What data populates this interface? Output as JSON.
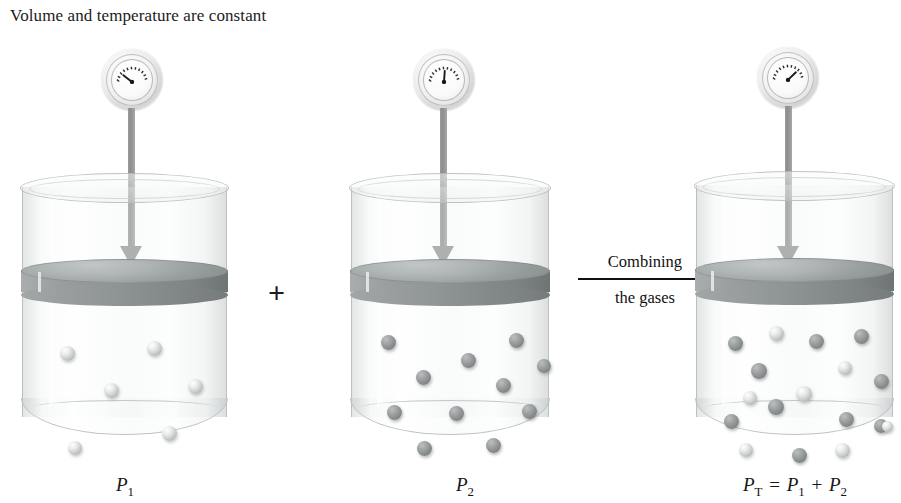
{
  "caption": "Volume and temperature are constant",
  "operators": {
    "plus": "+"
  },
  "transition": {
    "label_top": "Combining",
    "label_bottom": "the gases"
  },
  "cylinders": [
    {
      "id": "cylinder-1",
      "gauge_name": "pressure-gauge-1",
      "gauge_needle_angle_deg": -52,
      "label_main": "P",
      "label_sub": "1",
      "label_full": "P₁",
      "molecule_counts": {
        "light": 6,
        "dark": 0
      },
      "molecules": [
        {
          "type": "light",
          "x": 38,
          "y": 173,
          "size": 15
        },
        {
          "type": "light",
          "x": 125,
          "y": 168,
          "size": 15
        },
        {
          "type": "light",
          "x": 82,
          "y": 210,
          "size": 15
        },
        {
          "type": "light",
          "x": 166,
          "y": 206,
          "size": 15
        },
        {
          "type": "light",
          "x": 140,
          "y": 253,
          "size": 15
        },
        {
          "type": "light",
          "x": 46,
          "y": 268,
          "size": 14
        }
      ]
    },
    {
      "id": "cylinder-2",
      "gauge_name": "pressure-gauge-2",
      "gauge_needle_angle_deg": 4,
      "label_main": "P",
      "label_sub": "2",
      "label_full": "P₂",
      "molecule_counts": {
        "light": 0,
        "dark": 11
      },
      "molecules": [
        {
          "type": "dark",
          "x": 30,
          "y": 162,
          "size": 15
        },
        {
          "type": "dark",
          "x": 158,
          "y": 160,
          "size": 15
        },
        {
          "type": "dark",
          "x": 110,
          "y": 180,
          "size": 15
        },
        {
          "type": "dark",
          "x": 65,
          "y": 197,
          "size": 15
        },
        {
          "type": "dark",
          "x": 145,
          "y": 205,
          "size": 15
        },
        {
          "type": "dark",
          "x": 36,
          "y": 232,
          "size": 15
        },
        {
          "type": "dark",
          "x": 98,
          "y": 233,
          "size": 15
        },
        {
          "type": "dark",
          "x": 171,
          "y": 231,
          "size": 15
        },
        {
          "type": "dark",
          "x": 66,
          "y": 268,
          "size": 15
        },
        {
          "type": "dark",
          "x": 135,
          "y": 265,
          "size": 15
        },
        {
          "type": "dark",
          "x": 186,
          "y": 186,
          "size": 14
        }
      ]
    },
    {
      "id": "cylinder-3",
      "gauge_name": "pressure-gauge-3",
      "gauge_needle_angle_deg": 46,
      "label_main": "P",
      "label_sub": "T",
      "label_full": "P_T = P₁ + P₂",
      "label_terms": [
        {
          "main": "P",
          "sub": "T"
        },
        {
          "op": "="
        },
        {
          "main": "P",
          "sub": "1"
        },
        {
          "op": "+"
        },
        {
          "main": "P",
          "sub": "2"
        }
      ],
      "molecule_counts": {
        "light": 7,
        "dark": 10
      },
      "molecules": [
        {
          "type": "dark",
          "x": 32,
          "y": 165,
          "size": 15
        },
        {
          "type": "light",
          "x": 73,
          "y": 155,
          "size": 15
        },
        {
          "type": "dark",
          "x": 113,
          "y": 163,
          "size": 15
        },
        {
          "type": "dark",
          "x": 158,
          "y": 158,
          "size": 15
        },
        {
          "type": "dark",
          "x": 55,
          "y": 192,
          "size": 16
        },
        {
          "type": "light",
          "x": 142,
          "y": 190,
          "size": 14
        },
        {
          "type": "dark",
          "x": 178,
          "y": 203,
          "size": 15
        },
        {
          "type": "light",
          "x": 47,
          "y": 220,
          "size": 14
        },
        {
          "type": "light",
          "x": 100,
          "y": 215,
          "size": 16
        },
        {
          "type": "dark",
          "x": 72,
          "y": 228,
          "size": 16
        },
        {
          "type": "dark",
          "x": 28,
          "y": 243,
          "size": 15
        },
        {
          "type": "dark",
          "x": 143,
          "y": 241,
          "size": 15
        },
        {
          "type": "dark",
          "x": 178,
          "y": 248,
          "size": 14
        },
        {
          "type": "light",
          "x": 186,
          "y": 250,
          "size": 11
        },
        {
          "type": "light",
          "x": 43,
          "y": 272,
          "size": 14
        },
        {
          "type": "dark",
          "x": 96,
          "y": 277,
          "size": 15
        },
        {
          "type": "light",
          "x": 139,
          "y": 272,
          "size": 15
        }
      ]
    }
  ],
  "colors": {
    "molecule_light": "#d2d5d5",
    "molecule_dark": "#8a8e8e",
    "piston": "#9aa0a0",
    "arrow_shaft": "#949494",
    "text": "#151515",
    "background": "#ffffff"
  }
}
